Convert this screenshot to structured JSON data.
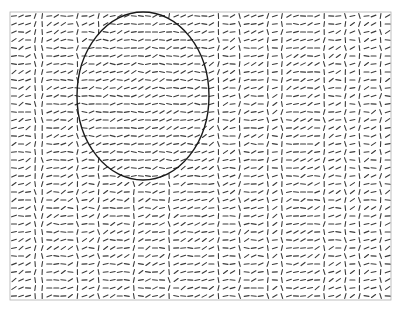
{
  "figure": {
    "width": 403,
    "height": 312,
    "frame": {
      "x": 10,
      "y": 12,
      "width": 381,
      "height": 288,
      "color": "#b0b0b0"
    },
    "grid": {
      "cols": 54,
      "rows": 36,
      "dx": 7.05,
      "dy": 8.0,
      "segment_length": 5,
      "segment_color": "#3a3a3a"
    },
    "vertical_columns": [
      3,
      4,
      9,
      12,
      17,
      22,
      29,
      32,
      36,
      38,
      44,
      47,
      49,
      52
    ],
    "ellipse": {
      "cx": 143,
      "cy": 96,
      "rx": 66,
      "ry": 84,
      "stroke": "#1a1a1a",
      "stroke_width": 1.4
    }
  }
}
